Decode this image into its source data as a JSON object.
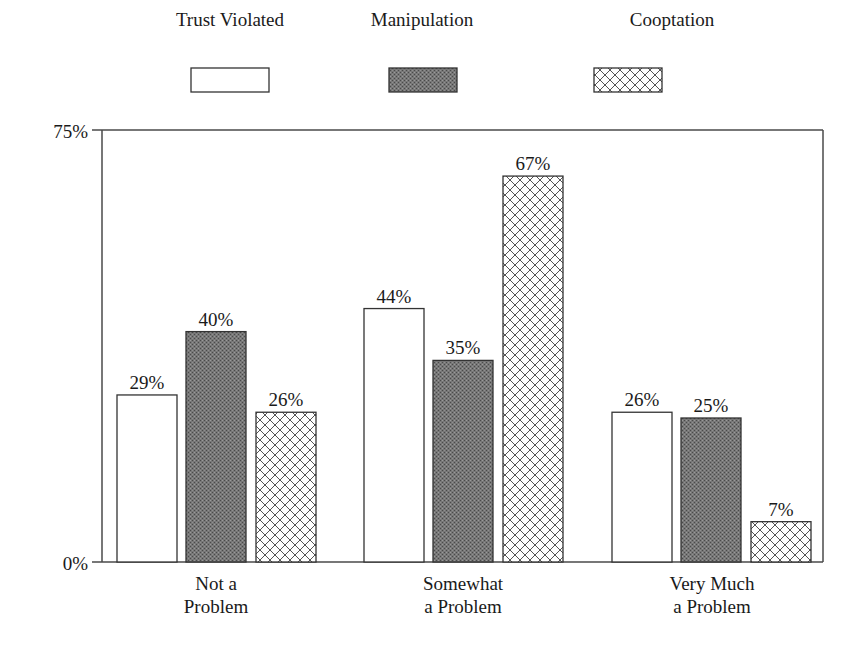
{
  "chart_data": {
    "type": "bar",
    "title": "",
    "xlabel": "",
    "ylabel": "",
    "ylim": [
      0,
      75
    ],
    "y_ticks": [
      "0%",
      "75%"
    ],
    "grid": false,
    "legend_position": "top",
    "categories": [
      [
        "Not a",
        "Problem"
      ],
      [
        "Somewhat",
        "a Problem"
      ],
      [
        "Very Much",
        "a Problem"
      ]
    ],
    "series": [
      {
        "name": "Trust Violated",
        "pattern": "white",
        "values": [
          29,
          44,
          26
        ],
        "labels": [
          "29%",
          "44%",
          "26%"
        ]
      },
      {
        "name": "Manipulation",
        "pattern": "dark-stipple",
        "values": [
          40,
          35,
          25
        ],
        "labels": [
          "40%",
          "35%",
          "25%"
        ]
      },
      {
        "name": "Cooptation",
        "pattern": "crosshatch",
        "values": [
          26,
          67,
          7
        ],
        "labels": [
          "26%",
          "67%",
          "7%"
        ]
      }
    ]
  },
  "colors": {
    "axis": "#4a4a4a",
    "text": "#1a1a1a",
    "manipulation_fill": "#6e6e6e",
    "crosshatch_line": "#555555"
  }
}
